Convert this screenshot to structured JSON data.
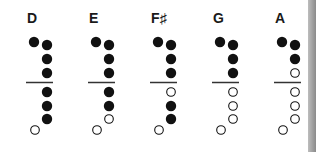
{
  "colors": {
    "filled": "#111111",
    "open_stroke": "#111111",
    "divider": "#333333",
    "edge_bar": "#9a9a9a"
  },
  "notes": [
    {
      "label": "D",
      "x": 26,
      "thumb": "closed",
      "upper": [
        "closed",
        "closed",
        "closed"
      ],
      "lower": [
        "closed",
        "closed",
        "closed"
      ],
      "bottom": "open"
    },
    {
      "label": "E",
      "x": 88,
      "thumb": "closed",
      "upper": [
        "closed",
        "closed",
        "closed"
      ],
      "lower": [
        "closed",
        "closed",
        "open"
      ],
      "bottom": "open"
    },
    {
      "label": "F♯",
      "x": 150,
      "thumb": "closed",
      "upper": [
        "closed",
        "closed",
        "closed"
      ],
      "lower": [
        "open",
        "closed",
        "closed"
      ],
      "bottom": "open"
    },
    {
      "label": "G",
      "x": 212,
      "thumb": "closed",
      "upper": [
        "closed",
        "closed",
        "closed"
      ],
      "lower": [
        "open",
        "open",
        "open"
      ],
      "bottom": "open"
    },
    {
      "label": "A",
      "x": 274,
      "thumb": "closed",
      "upper": [
        "closed",
        "closed",
        "open"
      ],
      "lower": [
        "open",
        "open",
        "open"
      ],
      "bottom": "open"
    }
  ]
}
